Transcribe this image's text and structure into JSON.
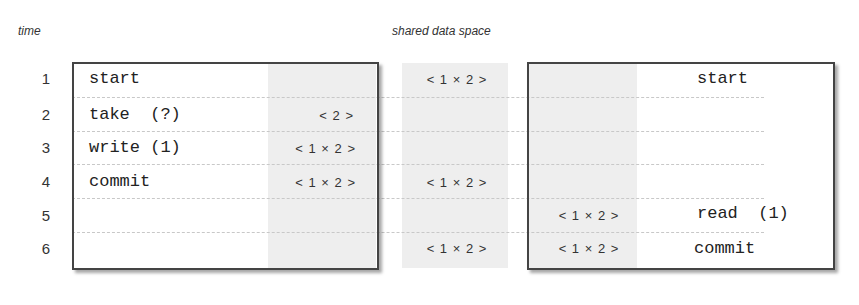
{
  "headings": {
    "time": "time",
    "shared": "shared data space"
  },
  "rows": [
    "1",
    "2",
    "3",
    "4",
    "5",
    "6"
  ],
  "left_process": {
    "ops": [
      {
        "row": 1,
        "text": "start"
      },
      {
        "row": 2,
        "text": "take  (?)"
      },
      {
        "row": 3,
        "text": "write (1)"
      },
      {
        "row": 4,
        "text": "commit"
      }
    ],
    "local_space": [
      {
        "row": 2,
        "text": "< 2 >"
      },
      {
        "row": 3,
        "text": "< 1 × 2 >"
      },
      {
        "row": 4,
        "text": "< 1 × 2 >"
      }
    ]
  },
  "shared_space": [
    {
      "row": 1,
      "text": "< 1 × 2 >"
    },
    {
      "row": 4,
      "text": "< 1 × 2 >"
    },
    {
      "row": 6,
      "text": "< 1 × 2 >"
    }
  ],
  "right_process": {
    "ops": [
      {
        "row": 1,
        "text": "start"
      },
      {
        "row": 5,
        "text": "read  (1)"
      },
      {
        "row": 6,
        "text": "commit"
      }
    ],
    "local_space": [
      {
        "row": 5,
        "text": "< 1 × 2 >"
      },
      {
        "row": 6,
        "text": "< 1 × 2 >"
      }
    ]
  }
}
